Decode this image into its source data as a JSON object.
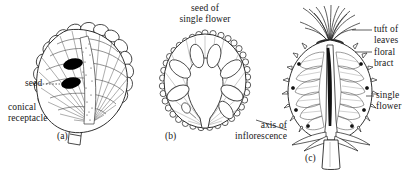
{
  "figure": {
    "type": "botanical-line-drawing",
    "background_color": "#ffffff",
    "ink_color": "#1a1a1a",
    "seed_fill_color": "#000000",
    "width": 409,
    "height": 171
  },
  "panels": [
    {
      "id": "a",
      "caption": "(a)",
      "subject": "conical-receptacle-section",
      "labels": [
        {
          "name": "seed",
          "lines": [
            "seed"
          ]
        },
        {
          "name": "conical-receptacle",
          "lines": [
            "conical",
            "receptacle"
          ]
        }
      ]
    },
    {
      "id": "b",
      "caption": "(b)",
      "subject": "transverse-section-with-single-flower-seed",
      "labels": [
        {
          "name": "seed-of-single-flower",
          "lines": [
            "seed of",
            "single flower"
          ]
        },
        {
          "name": "axis-of-inflorescence",
          "lines": [
            "axis of",
            "inflorescence"
          ]
        }
      ]
    },
    {
      "id": "c",
      "caption": "(c)",
      "subject": "longitudinal-section-of-inflorescence",
      "labels": [
        {
          "name": "tuft-of-leaves",
          "lines": [
            "tuft of",
            "leaves"
          ]
        },
        {
          "name": "floral-bract",
          "lines": [
            "floral",
            "bract"
          ]
        },
        {
          "name": "single-flower",
          "lines": [
            "single",
            "flower"
          ]
        }
      ]
    }
  ],
  "labels": {
    "seed": "seed",
    "conical_l1": "conical",
    "conical_l2": "receptacle",
    "caption_a": "(a)",
    "seed_of": "seed of",
    "single_flower": "single flower",
    "axis_of": "axis of",
    "inflorescence": "inflorescence",
    "caption_b": "(b)",
    "tuft_of": "tuft of",
    "leaves": "leaves",
    "floral": "floral",
    "bract": "bract",
    "single": "single",
    "flower": "flower",
    "caption_c": "(c)"
  }
}
